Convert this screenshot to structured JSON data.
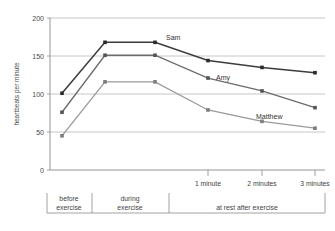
{
  "chart_data": {
    "type": "line",
    "title": "",
    "xlabel": "",
    "ylabel": "heartbeats per minute",
    "ylim": [
      0,
      200
    ],
    "yticks": [
      0,
      50,
      100,
      150,
      200
    ],
    "ytick_labels": [
      "0",
      "50",
      "100",
      "150",
      "200"
    ],
    "grid": true,
    "legend_position": "inline-labels",
    "x": [
      "before exercise",
      "during exercise start",
      "during exercise end",
      "1 minute",
      "2 minutes",
      "3 minutes"
    ],
    "series": [
      {
        "name": "Sam",
        "color": "#3c3c3c",
        "values": [
          101,
          168,
          168,
          144,
          135,
          128
        ]
      },
      {
        "name": "Amy",
        "color": "#6b6b6b",
        "values": [
          76,
          151,
          151,
          121,
          104,
          82
        ]
      },
      {
        "name": "Matthew",
        "color": "#9a9a9a",
        "values": [
          45,
          116,
          116,
          79,
          64,
          55
        ]
      }
    ],
    "x_tick_labels": [
      "1 minute",
      "2 minutes",
      "3 minutes"
    ],
    "category_brackets": [
      {
        "label_line1": "before",
        "label_line2": "exercise"
      },
      {
        "label_line1": "during",
        "label_line2": "exercise"
      },
      {
        "label_line1": "at rest after exercise",
        "label_line2": ""
      }
    ]
  },
  "axis": {
    "y_title": "heartbeats per minute",
    "y_tick_0": "0",
    "y_tick_50": "50",
    "y_tick_100": "100",
    "y_tick_150": "150",
    "y_tick_200": "200"
  },
  "labels": {
    "sam": "Sam",
    "amy": "Amy",
    "matthew": "Matthew",
    "time_1": "1 minute",
    "time_2": "2 minutes",
    "time_3": "3 minutes",
    "before_1": "before",
    "before_2": "exercise",
    "during_1": "during",
    "during_2": "exercise",
    "rest": "at rest after exercise"
  },
  "colors": {
    "sam_line": "#3c3c3c",
    "amy_line": "#6b6b6b",
    "matthew_line": "#9a9a9a",
    "gridline": "#b8b8b8",
    "axis": "#8a8a8a",
    "bracket": "#8a8a8a"
  }
}
